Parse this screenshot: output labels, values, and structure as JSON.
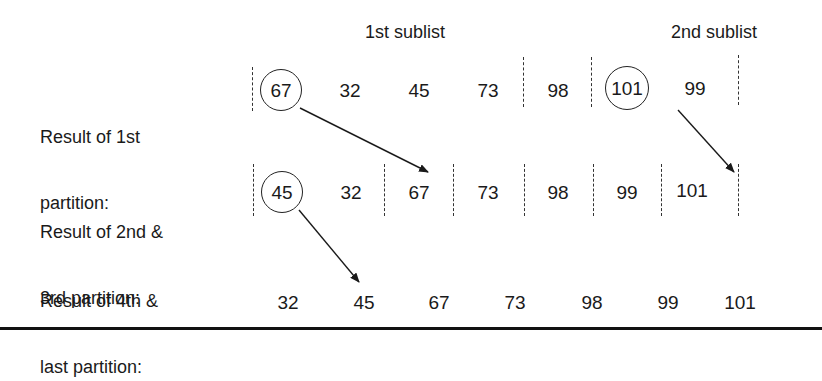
{
  "headers": {
    "first_sublist": "1st sublist",
    "second_sublist": "2nd sublist"
  },
  "rows": [
    {
      "label_line1": "Result of 1st",
      "label_line2": "partition:",
      "values": [
        "67",
        "32",
        "45",
        "73",
        "98",
        "101",
        "99"
      ],
      "circled": [
        "67",
        "101"
      ]
    },
    {
      "label_line1": "Result of 2nd &",
      "label_line2": "3rd partition:",
      "values": [
        "45",
        "32",
        "67",
        "73",
        "98",
        "99",
        "101"
      ],
      "circled": [
        "45"
      ]
    },
    {
      "label_line1": "Result of 4th &",
      "label_line2": "last partition:",
      "values": [
        "32",
        "45",
        "67",
        "73",
        "98",
        "99",
        "101"
      ],
      "circled": []
    }
  ],
  "arrows": [
    {
      "from": "row1 pivot 67",
      "to": "row2 67"
    },
    {
      "from": "row1 pivot 101",
      "to": "row2 101"
    },
    {
      "from": "row2 pivot 45",
      "to": "row3 45"
    }
  ],
  "colors": {
    "ink": "#1a1a1a",
    "background": "#ffffff"
  }
}
